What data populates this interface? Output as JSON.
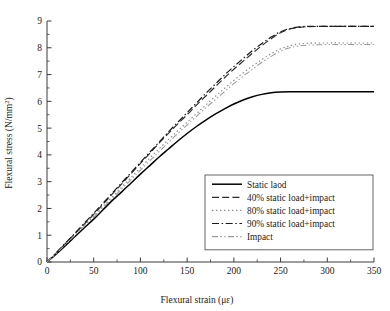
{
  "chart_data": {
    "type": "line",
    "title": "",
    "xlabel": "Flexural strain (με)",
    "ylabel": "Flexural stress (N/mm²)",
    "xlim": [
      0,
      350
    ],
    "ylim": [
      0,
      9
    ],
    "xticks": [
      0,
      50,
      100,
      150,
      200,
      250,
      300,
      350
    ],
    "yticks": [
      0,
      1,
      2,
      3,
      4,
      5,
      6,
      7,
      8,
      9
    ],
    "xticklabels": [
      "0",
      "50",
      "100",
      "150",
      "200",
      "250",
      "300",
      "350"
    ],
    "yticklabels": [
      "0",
      "1",
      "2",
      "3",
      "4",
      "5",
      "6",
      "7",
      "8",
      "9"
    ],
    "grid": false,
    "legend_position": "lower right",
    "series": [
      {
        "name": "Static laod",
        "linestyle": "solid",
        "color": "#000000",
        "x": [
          0,
          10,
          20,
          30,
          40,
          50,
          60,
          70,
          80,
          90,
          100,
          110,
          120,
          130,
          140,
          150,
          160,
          170,
          180,
          190,
          200,
          210,
          220,
          230,
          240,
          250,
          260,
          270,
          280,
          300,
          320,
          350
        ],
        "y": [
          0,
          0.3,
          0.62,
          0.95,
          1.28,
          1.6,
          1.95,
          2.3,
          2.62,
          2.95,
          3.28,
          3.6,
          3.92,
          4.22,
          4.52,
          4.8,
          5.06,
          5.3,
          5.52,
          5.72,
          5.9,
          6.05,
          6.17,
          6.26,
          6.32,
          6.35,
          6.36,
          6.36,
          6.36,
          6.36,
          6.36,
          6.36
        ]
      },
      {
        "name": "40% static load+impact",
        "linestyle": "dashed",
        "color": "#2b2b2b",
        "x": [
          0,
          10,
          20,
          30,
          40,
          50,
          60,
          70,
          80,
          90,
          100,
          110,
          120,
          130,
          140,
          150,
          160,
          170,
          180,
          190,
          200,
          210,
          220,
          230,
          240,
          250,
          260,
          270,
          280,
          300,
          320,
          350
        ],
        "y": [
          0,
          0.34,
          0.7,
          1.06,
          1.42,
          1.78,
          2.16,
          2.54,
          2.92,
          3.3,
          3.68,
          4.06,
          4.44,
          4.8,
          5.16,
          5.5,
          5.86,
          6.2,
          6.54,
          6.88,
          7.2,
          7.5,
          7.8,
          8.08,
          8.34,
          8.56,
          8.7,
          8.76,
          8.79,
          8.8,
          8.8,
          8.8
        ]
      },
      {
        "name": "80% static load+impact",
        "linestyle": "dotted",
        "color": "#8a8a8a",
        "x": [
          0,
          10,
          20,
          30,
          40,
          50,
          60,
          70,
          80,
          90,
          100,
          110,
          120,
          130,
          140,
          150,
          160,
          170,
          180,
          190,
          200,
          210,
          220,
          230,
          240,
          250,
          260,
          270,
          280,
          300,
          320,
          350
        ],
        "y": [
          0,
          0.33,
          0.68,
          1.02,
          1.37,
          1.72,
          2.08,
          2.44,
          2.8,
          3.16,
          3.52,
          3.88,
          4.23,
          4.57,
          4.9,
          5.22,
          5.54,
          5.86,
          6.18,
          6.48,
          6.78,
          7.06,
          7.32,
          7.56,
          7.78,
          7.96,
          8.08,
          8.14,
          8.17,
          8.18,
          8.18,
          8.18
        ]
      },
      {
        "name": "90% static load+impact",
        "linestyle": "dashdot",
        "color": "#1a1a1a",
        "x": [
          0,
          10,
          20,
          30,
          40,
          50,
          60,
          70,
          80,
          90,
          100,
          110,
          120,
          130,
          140,
          150,
          160,
          170,
          180,
          190,
          200,
          210,
          220,
          230,
          240,
          250,
          260,
          270,
          280,
          300,
          320,
          350
        ],
        "y": [
          0,
          0.35,
          0.72,
          1.08,
          1.45,
          1.82,
          2.2,
          2.58,
          2.96,
          3.34,
          3.72,
          4.1,
          4.48,
          4.86,
          5.22,
          5.58,
          5.94,
          6.3,
          6.64,
          6.98,
          7.3,
          7.6,
          7.9,
          8.16,
          8.4,
          8.6,
          8.72,
          8.78,
          8.8,
          8.8,
          8.8,
          8.8
        ]
      },
      {
        "name": "Impact",
        "linestyle": "dashdotdot",
        "color": "#9a9a9a",
        "x": [
          0,
          10,
          20,
          30,
          40,
          50,
          60,
          70,
          80,
          90,
          100,
          110,
          120,
          130,
          140,
          150,
          160,
          170,
          180,
          190,
          200,
          210,
          220,
          230,
          240,
          250,
          260,
          270,
          280,
          300,
          320,
          350
        ],
        "y": [
          0,
          0.32,
          0.66,
          1.0,
          1.34,
          1.68,
          2.03,
          2.38,
          2.73,
          3.08,
          3.43,
          3.78,
          4.12,
          4.46,
          4.8,
          5.12,
          5.44,
          5.76,
          6.06,
          6.36,
          6.66,
          6.94,
          7.2,
          7.46,
          7.68,
          7.88,
          8.0,
          8.07,
          8.1,
          8.12,
          8.12,
          8.12
        ]
      }
    ]
  },
  "legend": {
    "items": [
      {
        "label": "Static laod"
      },
      {
        "label": "40% static load+impact"
      },
      {
        "label": "80% static load+impact"
      },
      {
        "label": "90% static load+impact"
      },
      {
        "label": "Impact"
      }
    ]
  },
  "axes": {
    "x_title": "Flexural strain (με)",
    "y_title_main": "Flexural stress (N/mm",
    "y_title_sup": "2",
    "y_title_tail": ")"
  }
}
